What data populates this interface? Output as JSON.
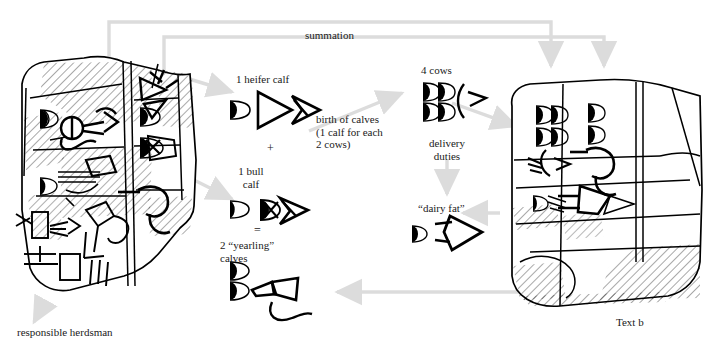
{
  "figure": {
    "type": "diagram",
    "background_color": "#ffffff",
    "ink_color": "#000000",
    "connector_color": "#d9d9d9"
  },
  "labels": {
    "summation": "summation",
    "heifer_calf": "1 heifer calf",
    "plus": "+",
    "bull_calf": "1 bull\ncalf",
    "equals": "=",
    "yearling_calves": "2 “yearling”\ncalves",
    "birth_of_calves": "birth of calves\n(1 calf for each\n2 cows)",
    "four_cows": "4 cows",
    "delivery_duties": "delivery\nduties",
    "dairy_fat": "“dairy fat”",
    "responsible_herdsman": "responsible herdsman",
    "text_b": "Text b"
  },
  "annotations": [
    {
      "name": "summation",
      "text": "summation",
      "x": 305,
      "y": 29
    },
    {
      "name": "heifer-calf",
      "text": "1 heifer calf",
      "x": 236,
      "y": 74
    },
    {
      "name": "plus-sign",
      "text": "+",
      "x": 268,
      "y": 146
    },
    {
      "name": "bull-calf",
      "text": "1 bull",
      "x": 243,
      "y": 169
    },
    {
      "name": "bull-calf-line2",
      "text": "calf",
      "x": 243,
      "y": 181
    },
    {
      "name": "equals-sign",
      "text": "=",
      "x": 255,
      "y": 228
    },
    {
      "name": "yearling-calves",
      "text": "2 “yearling”",
      "x": 222,
      "y": 243
    },
    {
      "name": "yearling-calves-line2",
      "text": "calves",
      "x": 222,
      "y": 255
    },
    {
      "name": "birth-of-calves",
      "text": "birth of calves",
      "x": 318,
      "y": 117
    },
    {
      "name": "birth-of-calves-line2",
      "text": "(1 calf for each",
      "x": 318,
      "y": 129
    },
    {
      "name": "birth-of-calves-line3",
      "text": "2 cows)",
      "x": 318,
      "y": 141
    },
    {
      "name": "four-cows",
      "text": "4 cows",
      "x": 425,
      "y": 68
    },
    {
      "name": "delivery-duties",
      "text": "delivery",
      "x": 428,
      "y": 141
    },
    {
      "name": "delivery-duties-line2",
      "text": "duties",
      "x": 436,
      "y": 153
    },
    {
      "name": "dairy-fat",
      "text": "“dairy fat”",
      "x": 421,
      "y": 206
    },
    {
      "name": "responsible-herdsman",
      "text": "responsible herdsman",
      "x": 18,
      "y": 330
    },
    {
      "name": "text-b",
      "text": "Text b",
      "x": 617,
      "y": 320
    }
  ],
  "sign_groups": [
    {
      "name": "heifer-calf-signs",
      "label": "1 heifer calf",
      "count": 1
    },
    {
      "name": "bull-calf-signs",
      "label": "1 bull calf",
      "count": 1
    },
    {
      "name": "yearling-calves-signs",
      "label": "2 yearling calves",
      "count": 2
    },
    {
      "name": "four-cows-signs",
      "label": "4 cows",
      "count": 4
    },
    {
      "name": "dairy-fat-signs",
      "label": "dairy fat",
      "count": 1
    }
  ],
  "tablets": [
    {
      "name": "tablet-text-a",
      "caption": "responsible herdsman"
    },
    {
      "name": "tablet-text-b",
      "caption": "Text b"
    }
  ]
}
